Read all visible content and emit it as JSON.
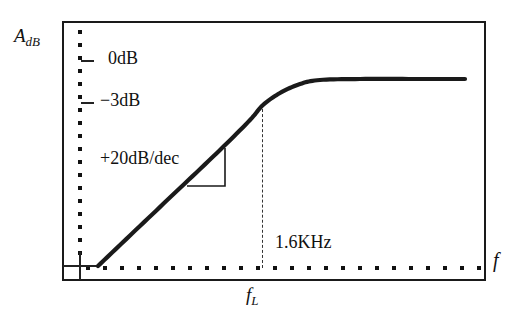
{
  "figure": {
    "type": "bode-magnitude-plot",
    "background": "#ffffff",
    "line_color": "#1a1a1a"
  },
  "axes": {
    "y_title": "A",
    "y_title_sub": "dB",
    "x_title": "f",
    "frame": {
      "left": 62,
      "top": 21,
      "width": 424,
      "height": 260
    }
  },
  "ticks": {
    "y": [
      {
        "name": "0dB",
        "label": "0dB",
        "y": 60
      },
      {
        "name": "-3dB",
        "label": "−3dB",
        "y": 102
      }
    ],
    "x": [
      {
        "name": "fL",
        "label": "f",
        "label_sub": "L",
        "x": 262
      }
    ]
  },
  "annotations": {
    "slope": "+20dB/dec",
    "corner_frequency": "1.6KHz"
  },
  "chart_data": {
    "type": "line",
    "title": "",
    "xlabel": "f",
    "ylabel": "A_dB",
    "grid": false,
    "legend": null,
    "tick_labels": {
      "y": [
        "0dB",
        "−3dB"
      ],
      "x": [
        "f_L"
      ]
    },
    "annotations": [
      {
        "text": "+20dB/dec",
        "meaning": "asymptotic slope of rising region"
      },
      {
        "text": "1.6KHz",
        "meaning": "value of corner frequency f_L"
      },
      {
        "text": "0dB",
        "meaning": "passband reference level"
      },
      {
        "text": "−3dB",
        "meaning": "half-power level at f_L"
      }
    ],
    "series": [
      {
        "name": "magnitude response",
        "points": [
          [
            98,
            266
          ],
          [
            140,
            226
          ],
          [
            180,
            188
          ],
          [
            220,
            150
          ],
          [
            250,
            120
          ],
          [
            263,
            105
          ],
          [
            280,
            93
          ],
          [
            300,
            84
          ],
          [
            320,
            80
          ],
          [
            360,
            79
          ],
          [
            420,
            79
          ],
          [
            465,
            79
          ]
        ]
      }
    ],
    "markers": {
      "corner_point": [
        263,
        105
      ],
      "plateau_level_y": 79,
      "zero_db_y": 60,
      "minus3_db_y": 102
    },
    "slope_triangle": {
      "corner": [
        225,
        186
      ],
      "vertical_top": [
        225,
        148
      ],
      "horizontal_right": [
        187,
        186
      ]
    }
  }
}
